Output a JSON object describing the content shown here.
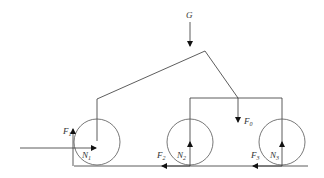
{
  "diagram": {
    "labels": {
      "G": "G",
      "F0": "F",
      "F0_sub": "0",
      "F1": "F",
      "F1_sub": "1",
      "N1": "N",
      "N1_sub": "1",
      "F2": "F",
      "F2_sub": "2",
      "N2": "N",
      "N2_sub": "2",
      "F3": "F",
      "F3_sub": "3",
      "N3": "N",
      "N3_sub": "3"
    },
    "colors": {
      "line": "#333333",
      "background": "#ffffff"
    }
  }
}
